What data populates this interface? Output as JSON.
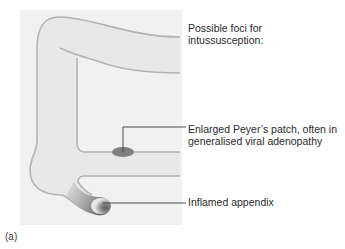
{
  "figure": {
    "panel_label": "(a)",
    "title": "Possible foci for intussusception:",
    "title_lines": [
      "Possible foci for",
      "intussusception:"
    ],
    "annotations": [
      {
        "id": "peyers-patch",
        "lines": [
          "Enlarged Peyer’s patch, often in",
          "generalised viral adenopathy"
        ]
      },
      {
        "id": "appendix",
        "lines": [
          "Inflamed appendix"
        ]
      }
    ],
    "colors": {
      "background_panel": "#f1f1f1",
      "intestine_fill": "#e8e8e8",
      "intestine_outline": "#b3b3b3",
      "peyers_patch": "#7f7f7f",
      "appendix_inflamed": "#6e6e6e",
      "leader_line": "#3a3a3a",
      "text": "#2a2a2a"
    }
  }
}
